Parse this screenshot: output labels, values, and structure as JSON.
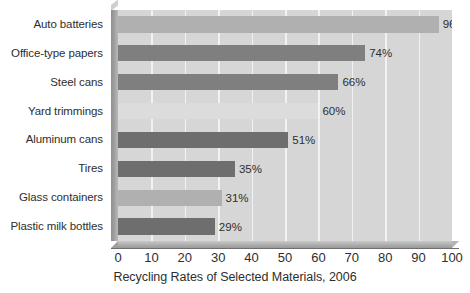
{
  "chart_data": {
    "type": "bar",
    "orientation": "horizontal",
    "title": "Recycling Rates of Selected Materials, 2006",
    "xlabel": "",
    "ylabel": "",
    "xlim": [
      0,
      100
    ],
    "xticks": [
      0,
      10,
      20,
      30,
      40,
      50,
      60,
      70,
      80,
      90,
      100
    ],
    "xtick_labels": [
      "0",
      "10",
      "20",
      "30",
      "40",
      "50",
      "60",
      "70",
      "80",
      "90",
      "100"
    ],
    "grid": true,
    "legend": "none",
    "categories": [
      "Auto batteries",
      "Office-type papers",
      "Steel cans",
      "Yard trimmings",
      "Aluminum cans",
      "Tires",
      "Glass containers",
      "Plastic milk bottles"
    ],
    "values": [
      96,
      74,
      66,
      60,
      51,
      35,
      31,
      29
    ],
    "value_labels": [
      "96%",
      "74%",
      "66%",
      "60%",
      "51%",
      "35%",
      "31%",
      "29%"
    ],
    "bar_colors": [
      "#b0b0b0",
      "#7f7f7f",
      "#7f7f7f",
      "#dcdcdc",
      "#6e6e6e",
      "#6e6e6e",
      "#b0b0b0",
      "#6e6e6e"
    ]
  },
  "style": {
    "plot_background": "#d6d6d6",
    "gridline_color": "#f2f2f2",
    "canvas_background": "#ffffff",
    "text_color": "#2e2e2e",
    "axis_color": "#6f6f6f"
  }
}
